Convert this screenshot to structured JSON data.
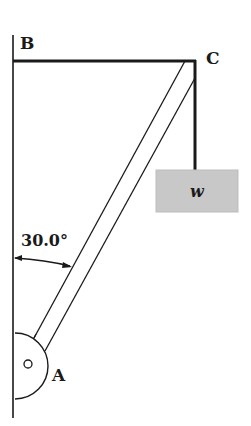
{
  "diagram": {
    "type": "statics-boom-diagram",
    "labels": {
      "top_left": "B",
      "top_right": "C",
      "pivot": "A",
      "weight": "w",
      "angle": "30.0°"
    },
    "colors": {
      "line": "#1a1a1a",
      "weight_fill": "#c8c8c8",
      "background": "#ffffff"
    },
    "elements": [
      "wall",
      "horizontal-cable-BC",
      "boom-AC",
      "vertical-cable-C-to-weight",
      "weight-block",
      "hinge-A",
      "angle-arc"
    ]
  }
}
